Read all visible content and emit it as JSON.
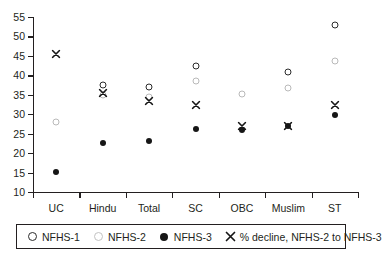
{
  "chart_data": {
    "type": "scatter",
    "title": "",
    "subtitle": "",
    "xlabel": "",
    "ylabel": "",
    "categories": [
      "UC",
      "Hindu",
      "Total",
      "SC",
      "OBC",
      "Muslim",
      "ST"
    ],
    "ylim": [
      10,
      55
    ],
    "y_ticks": [
      10,
      15,
      20,
      25,
      30,
      35,
      40,
      45,
      50,
      55
    ],
    "grid": false,
    "legend_position": "bottom",
    "series": [
      {
        "name": "NFHS-1",
        "marker": "open-circle-dark",
        "color": "#2b2b2b",
        "values": [
          null,
          37.4,
          37.0,
          42.5,
          null,
          40.8,
          53.0
        ]
      },
      {
        "name": "NFHS-2",
        "marker": "open-circle-light",
        "color": "#b9b9b9",
        "values": [
          27.9,
          34.9,
          34.4,
          38.5,
          35.2,
          36.8,
          43.7
        ]
      },
      {
        "name": "NFHS-3",
        "marker": "filled-circle",
        "color": "#161616",
        "values": [
          15.2,
          22.5,
          23.0,
          26.3,
          26.0,
          27.0,
          29.9
        ]
      },
      {
        "name": "% decline, NFHS-2 to NFHS-3",
        "marker": "x-cross",
        "color": "#161616",
        "values": [
          45.5,
          35.5,
          33.3,
          32.5,
          26.9,
          27.1,
          32.5
        ]
      }
    ]
  },
  "legend": {
    "items": [
      {
        "label": "NFHS-1",
        "marker": "open-circle-dark"
      },
      {
        "label": "NFHS-2",
        "marker": "open-circle-light"
      },
      {
        "label": "NFHS-3",
        "marker": "filled-circle"
      },
      {
        "label": "% decline, NFHS-2 to NFHS-3",
        "marker": "x-cross"
      }
    ]
  }
}
